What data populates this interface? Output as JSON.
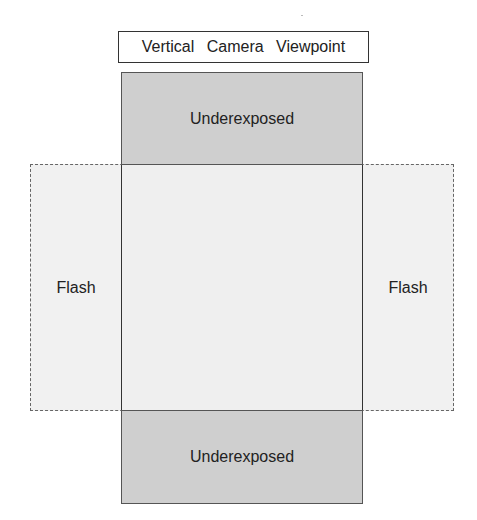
{
  "diagram": {
    "title": "Vertical Camera Viewpoint",
    "top_region": {
      "label": "Underexposed"
    },
    "bottom_region": {
      "label": "Underexposed"
    },
    "left_region": {
      "label": "Flash"
    },
    "right_region": {
      "label": "Flash"
    },
    "colors": {
      "underexposed_fill": "#cfcfcf",
      "flash_fill": "#f1f1f1",
      "center_fill": "#efefef",
      "stroke": "#333333"
    }
  }
}
